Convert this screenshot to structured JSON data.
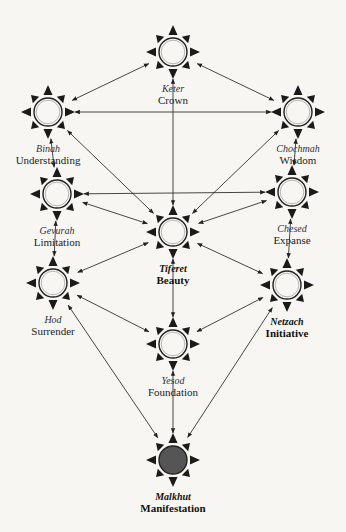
{
  "diagram": {
    "colors": {
      "ray": "#1a1a1a",
      "circle_stroke": "#222222",
      "circle_fill": "#f7f6f3",
      "malkhut_fill": "#555555",
      "line": "#333333"
    },
    "nodes": [
      {
        "id": "keter",
        "hebrew": "Keter",
        "english": "Crown",
        "x": 173,
        "y": 52,
        "bold": false,
        "filled": false
      },
      {
        "id": "binah",
        "hebrew": "Binah",
        "english": "Understanding",
        "x": 48,
        "y": 112,
        "bold": false,
        "filled": false
      },
      {
        "id": "chochmah",
        "hebrew": "Chochmah",
        "english": "Wisdom",
        "x": 298,
        "y": 112,
        "bold": false,
        "filled": false
      },
      {
        "id": "gevurah",
        "hebrew": "Gevurah",
        "english": "Limitation",
        "x": 57,
        "y": 194,
        "bold": false,
        "filled": false
      },
      {
        "id": "chesed",
        "hebrew": "Chesed",
        "english": "Expanse",
        "x": 292,
        "y": 192,
        "bold": false,
        "filled": false
      },
      {
        "id": "tiferet",
        "hebrew": "Tiferet",
        "english": "Beauty",
        "x": 173,
        "y": 232,
        "bold": true,
        "filled": false
      },
      {
        "id": "hod",
        "hebrew": "Hod",
        "english": "Surrender",
        "x": 53,
        "y": 283,
        "bold": false,
        "filled": false
      },
      {
        "id": "netzach",
        "hebrew": "Netzach",
        "english": "Initiative",
        "x": 287,
        "y": 285,
        "bold": true,
        "filled": false
      },
      {
        "id": "yesod",
        "hebrew": "Yesod",
        "english": "Foundation",
        "x": 173,
        "y": 344,
        "bold": false,
        "filled": false
      },
      {
        "id": "malkhut",
        "hebrew": "Malkhut",
        "english": "Manifestation",
        "x": 173,
        "y": 460,
        "bold": true,
        "filled": true
      }
    ],
    "connections": [
      [
        "keter",
        "binah"
      ],
      [
        "keter",
        "chochmah"
      ],
      [
        "keter",
        "tiferet"
      ],
      [
        "binah",
        "chochmah"
      ],
      [
        "binah",
        "gevurah"
      ],
      [
        "binah",
        "tiferet"
      ],
      [
        "chochmah",
        "chesed"
      ],
      [
        "chochmah",
        "tiferet"
      ],
      [
        "gevurah",
        "chesed"
      ],
      [
        "gevurah",
        "tiferet"
      ],
      [
        "gevurah",
        "hod"
      ],
      [
        "chesed",
        "tiferet"
      ],
      [
        "chesed",
        "netzach"
      ],
      [
        "tiferet",
        "hod"
      ],
      [
        "tiferet",
        "netzach"
      ],
      [
        "tiferet",
        "yesod"
      ],
      [
        "hod",
        "yesod"
      ],
      [
        "hod",
        "malkhut"
      ],
      [
        "netzach",
        "yesod"
      ],
      [
        "netzach",
        "malkhut"
      ],
      [
        "yesod",
        "malkhut"
      ]
    ]
  }
}
